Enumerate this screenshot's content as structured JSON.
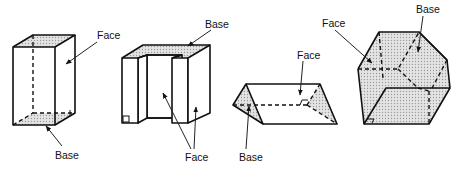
{
  "figures": [
    {
      "name": "rectangular-prism",
      "labels": [
        {
          "text": "Face",
          "x": 97,
          "y": 30
        },
        {
          "text": "Base",
          "x": 55,
          "y": 150
        }
      ]
    },
    {
      "name": "u-shaped-prism",
      "labels": [
        {
          "text": "Base",
          "x": 205,
          "y": 19
        },
        {
          "text": "Face",
          "x": 185,
          "y": 152
        }
      ]
    },
    {
      "name": "triangular-prism",
      "labels": [
        {
          "text": "Face",
          "x": 297,
          "y": 50
        },
        {
          "text": "Base",
          "x": 239,
          "y": 152
        }
      ]
    },
    {
      "name": "hexagonal-prism",
      "labels": [
        {
          "text": "Face",
          "x": 322,
          "y": 18
        },
        {
          "text": "Base",
          "x": 416,
          "y": 4
        }
      ]
    }
  ],
  "colors": {
    "line": "#111111",
    "shade": "#bdbdbd",
    "background": "#ffffff"
  }
}
